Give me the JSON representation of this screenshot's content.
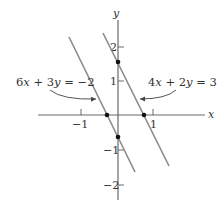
{
  "diagram": {
    "axes": {
      "x_label": "x",
      "y_label": "y",
      "x_ticks": [
        {
          "value": -1,
          "label": "−1"
        },
        {
          "value": 1,
          "label": "1"
        }
      ],
      "y_ticks": [
        {
          "value": 2,
          "label": "2"
        },
        {
          "value": 1,
          "label": "1"
        },
        {
          "value": -1,
          "label": "−1"
        },
        {
          "value": -2,
          "label": "−2"
        }
      ]
    },
    "lines": [
      {
        "name": "left-line",
        "equation": "6x + 3y = −2",
        "eq_parts": {
          "a": "6",
          "x": "x",
          "op": " + 3",
          "y": "y",
          "rhs": " = −2"
        },
        "slope": -2,
        "intercepts": {
          "x": "-1/3",
          "y": "-2/3"
        }
      },
      {
        "name": "right-line",
        "equation": "4x + 2y = 3",
        "eq_parts": {
          "a": "4",
          "x": "x",
          "op": " + 2",
          "y": "y",
          "rhs": " = 3"
        },
        "slope": -2,
        "intercepts": {
          "x": "3/4",
          "y": "3/2"
        }
      }
    ],
    "points": [
      {
        "x": -0.333,
        "y": 0
      },
      {
        "x": 0,
        "y": -0.667
      },
      {
        "x": 0.75,
        "y": 0
      },
      {
        "x": 0,
        "y": 1.5
      }
    ]
  }
}
